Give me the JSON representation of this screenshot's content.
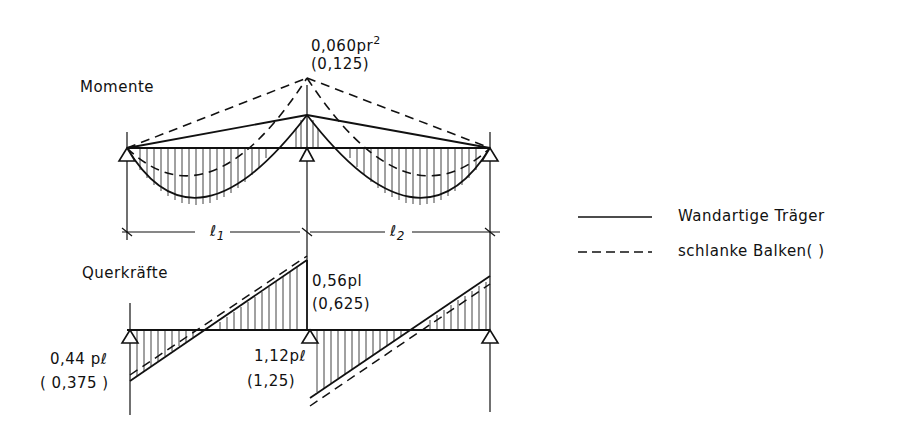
{
  "diagram": {
    "moments": {
      "title": "Momente",
      "peak_label": "0,060pr",
      "peak_label_exp": "2",
      "peak_label_alt": "(0,125)"
    },
    "spans": [
      "l1",
      "l2"
    ],
    "span_labels": {
      "l1_main": "ℓ",
      "l1_sub": "1",
      "l2_main": "ℓ",
      "l2_sub": "2"
    },
    "shear": {
      "title": "Querkräfte",
      "mid_top_label": "0,56pl",
      "mid_top_alt": "(0,625)",
      "left_label": "0,44 pℓ",
      "left_alt": "( 0,375 )",
      "mid_bottom_label": "1,12pℓ",
      "mid_bottom_alt": "(1,25)"
    },
    "legend": [
      {
        "style": "solid",
        "label": "Wandartige Träger"
      },
      {
        "style": "dashed",
        "label": "schlanke Balken( )"
      }
    ],
    "colors": {
      "ink": "#111111",
      "background": "#ffffff"
    }
  }
}
